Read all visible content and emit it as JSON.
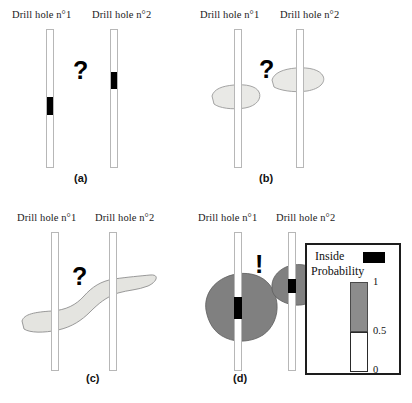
{
  "figure": {
    "width": 412,
    "height": 403,
    "background": "#ffffff"
  },
  "colors": {
    "interval_black": "#000000",
    "possible_body_light": "#e9e9e6",
    "connected_body_light": "#e2e2de",
    "probability_gray": "#808080",
    "tube_outline": "#b7b7b7",
    "legend_border": "#1d1d1d",
    "bar_gray": "#8c8c8c"
  },
  "hole_labels": {
    "hole1": "Drill hole n°1",
    "hole2": "Drill hole n°2"
  },
  "panels": [
    {
      "id": "a",
      "label": "(a)",
      "annotation": "?",
      "annotation_meaning": "uncertain-connection",
      "description": "Two drill holes each intersecting a black mineralized interval at different depths"
    },
    {
      "id": "b",
      "label": "(b)",
      "annotation": "?",
      "annotation_meaning": "uncertain-connection",
      "description": "Two separate small lenticular bodies, one around each drill hole intersection"
    },
    {
      "id": "c",
      "label": "(c)",
      "annotation": "?",
      "annotation_meaning": "uncertain-connection",
      "description": "One single elongated body connecting both drill hole intersections"
    },
    {
      "id": "d",
      "label": "(d)",
      "annotation": "!",
      "annotation_meaning": "probabilistic-answer",
      "description": "Probability halos around each intersection shown in gray with black inside cores"
    }
  ],
  "legend": {
    "inside_label": "Inside",
    "probability_label": "Probability",
    "ticks": [
      "1",
      "0.5",
      "0"
    ],
    "tick_values": [
      1,
      0.5,
      0
    ]
  }
}
